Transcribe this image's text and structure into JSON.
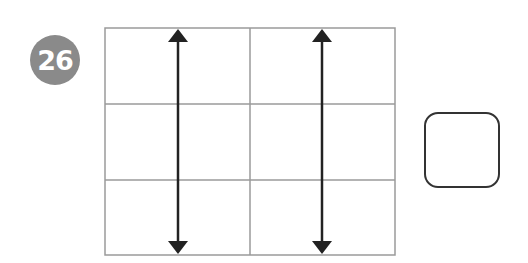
{
  "problem": {
    "number": "26",
    "badge_color": "#8a8a8a"
  },
  "grid": {
    "rows": 3,
    "cols": 2,
    "line_color": "#9a9a9a",
    "arrows": [
      {
        "orientation": "vertical",
        "type": "double-headed",
        "column_position": "middle of column 1"
      },
      {
        "orientation": "vertical",
        "type": "double-headed",
        "column_position": "middle of column 2"
      }
    ],
    "arrow_color": "#222222"
  },
  "answer_box": {
    "value": ""
  }
}
